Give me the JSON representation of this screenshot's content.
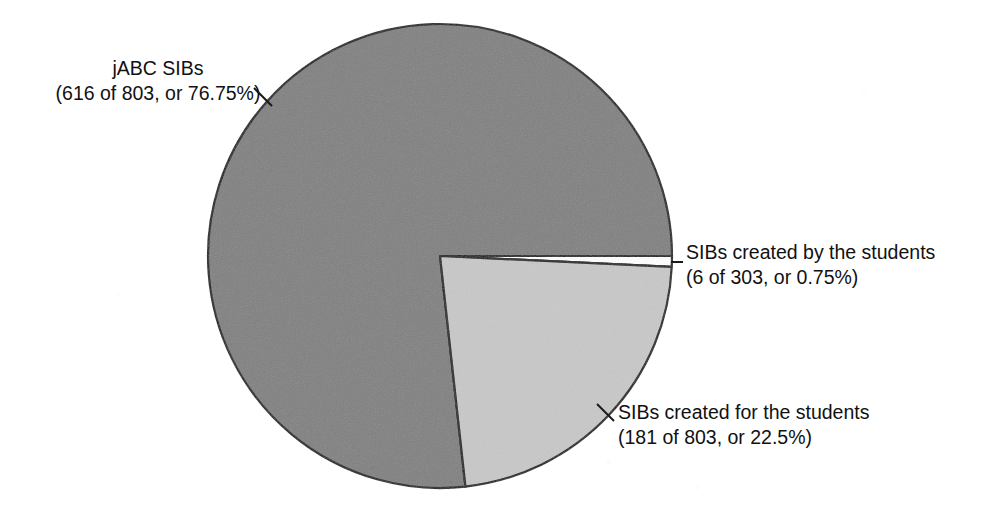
{
  "chart_data": {
    "type": "pie",
    "title": "",
    "subtitle": "",
    "xlabel": "",
    "ylabel": "",
    "legend_position": "none",
    "grid": false,
    "total": 803,
    "start_angle_deg": 0,
    "direction": "clockwise",
    "categories": [
      "jABC SIBs",
      "SIBs created by the students",
      "SIBs created for the students"
    ],
    "values": [
      76.75,
      0.75,
      22.5
    ],
    "counts": [
      616,
      6,
      181
    ],
    "slices": [
      {
        "name": "jABC SIBs",
        "label_line1": "jABC SIBs",
        "label_line2": "(616 of 803, or 76.75%)",
        "count": 616,
        "of": 803,
        "percent": 76.75,
        "color": "#808080",
        "stroke": "#1a1a1a"
      },
      {
        "name": "SIBs created by the students",
        "label_line1": "SIBs created by the students",
        "label_line2": "(6 of 303, or 0.75%)",
        "count": 6,
        "of": 303,
        "percent": 0.75,
        "color": "#ffffff",
        "stroke": "#1a1a1a"
      },
      {
        "name": "SIBs created for the students",
        "label_line1": "SIBs created for the students",
        "label_line2": "(181 of 803, or 22.5%)",
        "count": 181,
        "of": 803,
        "percent": 22.5,
        "color": "#c8c8c8",
        "stroke": "#1a1a1a"
      }
    ],
    "geometry": {
      "center_x": 440,
      "center_y": 256,
      "radius": 232
    },
    "colors": {
      "dark_gray": "#808080",
      "light_gray": "#c8c8c8",
      "white": "#ffffff",
      "outline": "#1a1a1a",
      "text": "#111111",
      "background": "#ffffff"
    }
  }
}
